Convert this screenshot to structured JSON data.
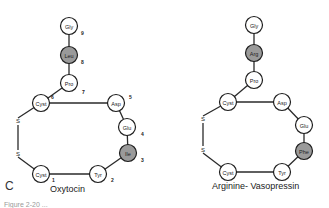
{
  "panel_label": "C",
  "caption_partial": "Figure 2-20  ...",
  "colors": {
    "highlight": "#9a9a9a",
    "normal": "#ffffff",
    "stroke": "#1e1e1e"
  },
  "molecules": [
    {
      "name": "Oxytocin",
      "residues": [
        {
          "label": "Gly",
          "num": "9",
          "x": 69,
          "y": 26,
          "highlight": false,
          "nx": 81,
          "ny": 35
        },
        {
          "label": "Leu",
          "num": "8",
          "x": 69,
          "y": 55,
          "highlight": true,
          "nx": 81,
          "ny": 64
        },
        {
          "label": "Pro",
          "num": "7",
          "x": 69,
          "y": 83,
          "highlight": false,
          "nx": 82,
          "ny": 94
        },
        {
          "label": "Cyst",
          "num": "6",
          "x": 41,
          "y": 103,
          "highlight": false,
          "nx": 51,
          "ny": 99
        },
        {
          "label": "Asp",
          "num": "5",
          "x": 116,
          "y": 103,
          "highlight": false,
          "nx": 129,
          "ny": 99
        },
        {
          "label": "Glu",
          "num": "4",
          "x": 127,
          "y": 127,
          "highlight": false,
          "nx": 141,
          "ny": 136
        },
        {
          "label": "Ile",
          "num": "3",
          "x": 128,
          "y": 153,
          "highlight": true,
          "nx": 141,
          "ny": 162
        },
        {
          "label": "Tyr",
          "num": "2",
          "x": 98,
          "y": 174,
          "highlight": false,
          "nx": 111,
          "ny": 182
        },
        {
          "label": "Cyst",
          "num": "1",
          "x": 41,
          "y": 174,
          "highlight": false,
          "nx": 52,
          "ny": 182
        }
      ],
      "s1": {
        "label": "S",
        "x": 18,
        "y": 121
      },
      "s2": {
        "label": "S",
        "x": 18,
        "y": 154
      },
      "title_x": 50,
      "title_y": 192
    },
    {
      "name": "Arginine- Vasopressin",
      "residues": [
        {
          "label": "Gly",
          "num": "",
          "x": 254,
          "y": 25,
          "highlight": false
        },
        {
          "label": "Arg",
          "num": "",
          "x": 254,
          "y": 53,
          "highlight": true
        },
        {
          "label": "Pro",
          "num": "",
          "x": 254,
          "y": 80,
          "highlight": false
        },
        {
          "label": "Cyst",
          "num": "",
          "x": 228,
          "y": 102,
          "highlight": false
        },
        {
          "label": "Asp",
          "num": "",
          "x": 282,
          "y": 102,
          "highlight": false
        },
        {
          "label": "Glu",
          "num": "",
          "x": 304,
          "y": 125,
          "highlight": false
        },
        {
          "label": "Phe",
          "num": "",
          "x": 304,
          "y": 151,
          "highlight": true
        },
        {
          "label": "Tyr",
          "num": "",
          "x": 282,
          "y": 172,
          "highlight": false
        },
        {
          "label": "Cyst",
          "num": "",
          "x": 228,
          "y": 172,
          "highlight": false
        }
      ],
      "s1": {
        "label": "S",
        "x": 203,
        "y": 119
      },
      "s2": {
        "label": "S",
        "x": 203,
        "y": 150
      },
      "title_x": 212,
      "title_y": 189
    }
  ]
}
